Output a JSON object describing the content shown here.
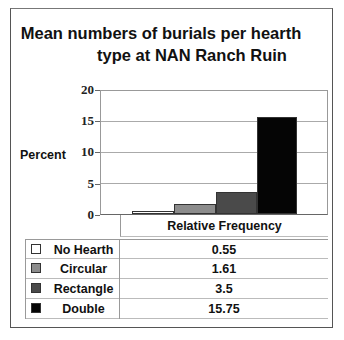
{
  "chart_data": {
    "type": "bar",
    "title": "Mean numbers of burials per hearth type at NAN Ranch Ruin",
    "title_lines": [
      "Mean numbers of burials per hearth",
      "type at NAN Ranch Ruin"
    ],
    "xlabel": "Relative Frequency",
    "ylabel": "Percent",
    "ylim": [
      0,
      20
    ],
    "yticks": [
      "0",
      "5",
      "10",
      "15",
      "20"
    ],
    "grid": true,
    "legend_position": "data-table-below",
    "categories": [
      "Relative Frequency"
    ],
    "series": [
      {
        "name": "No Hearth",
        "values": [
          0.55
        ],
        "value_label": "0.55",
        "color": "#ffffff"
      },
      {
        "name": "Circular",
        "values": [
          1.61
        ],
        "value_label": "1.61",
        "color": "#8c8c8c"
      },
      {
        "name": "Rectangle",
        "values": [
          3.5
        ],
        "value_label": "3.5",
        "color": "#4a4a4a"
      },
      {
        "name": "Double",
        "values": [
          15.75
        ],
        "value_label": "15.75",
        "color": "#050505"
      }
    ]
  }
}
